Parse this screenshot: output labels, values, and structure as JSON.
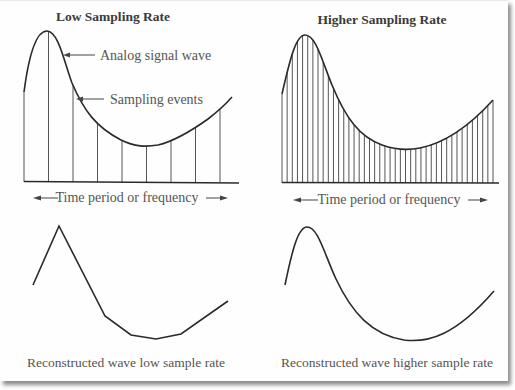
{
  "panels": {
    "low": {
      "title": "Low Sampling Rate",
      "axis_label": "Time period or frequency",
      "annotation_signal": "Analog signal wave",
      "annotation_samples": "Sampling events",
      "caption": "Reconstructed wave low sample rate",
      "sample_count": 9
    },
    "high": {
      "title": "Higher Sampling Rate",
      "axis_label": "Time period or frequency",
      "caption": "Reconstructed wave higher sample rate",
      "sample_count": 42
    }
  },
  "colors": {
    "line": "#2a2a2a",
    "sample_line": "#555555",
    "text": "#555555",
    "title": "#3a3a3a"
  }
}
